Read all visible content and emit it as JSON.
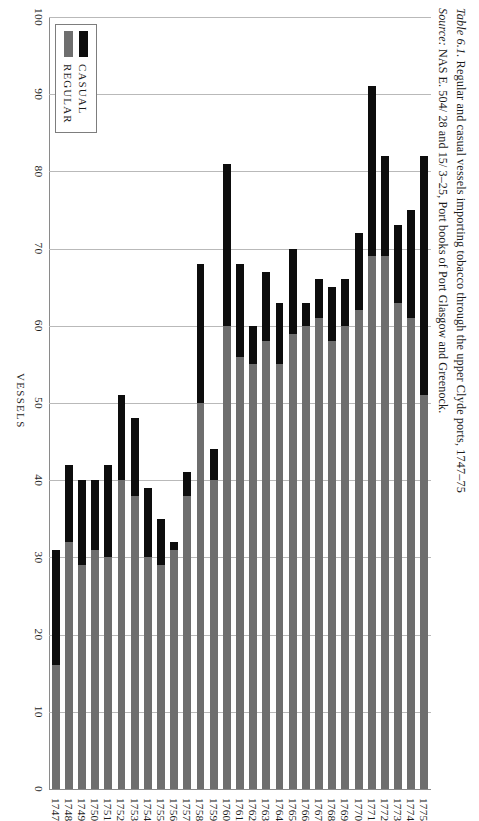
{
  "figure": {
    "caption_prefix": "Table 6.1.",
    "caption_text": "Regular and casual vessels importing tobacco through the upper Clyde ports, 1747–75",
    "source_prefix": "Source:",
    "source_text": "NAS E. 504/ 28 and 15/ 3–25, Port books of Port Glasgow and Greenock."
  },
  "legend": {
    "title": "",
    "items": [
      {
        "label": "CASUAL",
        "color": "#0d0d0d",
        "key": "casual"
      },
      {
        "label": "REGULAR",
        "color": "#6e6e6e",
        "key": "regular"
      }
    ]
  },
  "colors": {
    "casual": "#0d0d0d",
    "regular": "#6e6e6e",
    "gridline": "#b9b9b9",
    "axis": "#8a8a8a",
    "text": "#1c1c1c",
    "background": "#ffffff"
  },
  "chart_data": {
    "type": "bar",
    "orientation": "horizontal-printed-sideways",
    "title": "Regular and casual vessels importing tobacco through the upper Clyde ports, 1747–75",
    "xlabel": "VESSELS",
    "ylabel": "",
    "xlim": [
      0,
      100
    ],
    "xticks": [
      0,
      10,
      20,
      30,
      40,
      50,
      60,
      70,
      80,
      90,
      100
    ],
    "xtick_labels": [
      "0",
      "10",
      "20",
      "30",
      "40",
      "50",
      "60",
      "70",
      "80",
      "90",
      "100"
    ],
    "grid": true,
    "legend_position": "top-left",
    "stacked": true,
    "categories": [
      "1747",
      "1748",
      "1749",
      "1750",
      "1751",
      "1752",
      "1753",
      "1754",
      "1755",
      "1756",
      "1757",
      "1758",
      "1759",
      "1760",
      "1761",
      "1762",
      "1763",
      "1764",
      "1765",
      "1766",
      "1767",
      "1768",
      "1769",
      "1770",
      "1771",
      "1772",
      "1773",
      "1774",
      "1775"
    ],
    "series": [
      {
        "name": "REGULAR",
        "color": "#6e6e6e",
        "values": [
          16,
          32,
          29,
          31,
          30,
          40,
          38,
          30,
          29,
          31,
          38,
          50,
          40,
          60,
          56,
          55,
          58,
          55,
          59,
          60,
          61,
          58,
          60,
          62,
          69,
          69,
          63,
          61,
          51
        ]
      },
      {
        "name": "CASUAL",
        "color": "#0d0d0d",
        "values": [
          15,
          10,
          11,
          9,
          12,
          11,
          10,
          9,
          6,
          1,
          3,
          18,
          4,
          21,
          12,
          5,
          9,
          8,
          11,
          3,
          5,
          7,
          6,
          10,
          22,
          13,
          10,
          14,
          31
        ]
      }
    ],
    "totals": [
      31,
      42,
      40,
      40,
      42,
      51,
      48,
      39,
      35,
      32,
      41,
      68,
      44,
      81,
      68,
      60,
      67,
      63,
      70,
      63,
      66,
      65,
      66,
      72,
      91,
      82,
      73,
      75,
      82
    ]
  }
}
